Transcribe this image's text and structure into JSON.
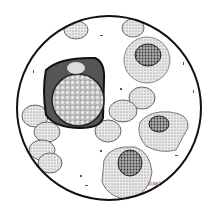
{
  "figure": {
    "signature": "RMC",
    "colors": {
      "border": "#111111",
      "background": "#ffffff",
      "cell_light": "#d8d8d8",
      "cell_dark": "#555555",
      "nucleus": "#333333"
    }
  }
}
